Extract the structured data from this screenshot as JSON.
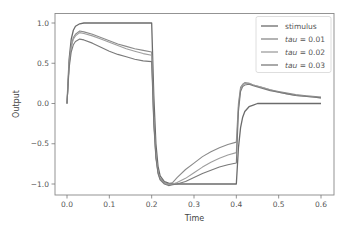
{
  "chart_data": {
    "type": "line",
    "title": "",
    "xlabel": "Time",
    "ylabel": "Output",
    "xlim": [
      -0.02,
      0.62
    ],
    "ylim": [
      -1.15,
      1.12
    ],
    "grid": false,
    "legend_position": "upper right",
    "xticks": [
      0.0,
      0.1,
      0.2,
      0.3,
      0.4,
      0.5,
      0.6
    ],
    "xtick_labels": [
      "0.0",
      "0.1",
      "0.2",
      "0.3",
      "0.4",
      "0.5",
      "0.6"
    ],
    "yticks": [
      1.0,
      0.5,
      0.0,
      -0.5,
      -1.0
    ],
    "ytick_labels": [
      "1.0",
      "0.5",
      "0.0",
      "−0.5",
      "−1.0"
    ],
    "series": [
      {
        "name": "stimulus",
        "label_prefix": "stimulus",
        "label_value": "",
        "color": "#6b6b6b",
        "x": [
          0.0,
          0.005,
          0.01,
          0.015,
          0.02,
          0.03,
          0.04,
          0.05,
          0.1,
          0.2,
          0.2,
          0.205,
          0.21,
          0.215,
          0.22,
          0.23,
          0.24,
          0.25,
          0.3,
          0.4,
          0.4,
          0.405,
          0.41,
          0.415,
          0.42,
          0.43,
          0.44,
          0.45,
          0.5,
          0.6
        ],
        "y": [
          0.0,
          0.55,
          0.8,
          0.91,
          0.96,
          0.99,
          1.0,
          1.0,
          1.0,
          1.0,
          1.0,
          0.1,
          -0.5,
          -0.78,
          -0.9,
          -0.97,
          -0.99,
          -1.0,
          -1.0,
          -1.0,
          -1.0,
          -0.55,
          -0.3,
          -0.17,
          -0.1,
          -0.04,
          -0.02,
          0.0,
          0.0,
          0.0
        ]
      },
      {
        "name": "tau = 0.01",
        "label_prefix": "tau",
        "label_value": " = 0.01",
        "color": "#8a8a8a",
        "x": [
          0.0,
          0.005,
          0.01,
          0.015,
          0.02,
          0.03,
          0.04,
          0.06,
          0.08,
          0.1,
          0.12,
          0.14,
          0.16,
          0.18,
          0.2,
          0.205,
          0.21,
          0.215,
          0.22,
          0.23,
          0.24,
          0.25,
          0.26,
          0.28,
          0.3,
          0.32,
          0.34,
          0.36,
          0.38,
          0.4,
          0.405,
          0.41,
          0.415,
          0.42,
          0.43,
          0.44,
          0.46,
          0.48,
          0.5,
          0.52,
          0.54,
          0.56,
          0.58,
          0.6
        ],
        "y": [
          0.0,
          0.5,
          0.72,
          0.82,
          0.86,
          0.9,
          0.89,
          0.86,
          0.82,
          0.78,
          0.74,
          0.71,
          0.68,
          0.66,
          0.64,
          -0.2,
          -0.65,
          -0.85,
          -0.93,
          -0.98,
          -1.0,
          -0.98,
          -0.92,
          -0.82,
          -0.74,
          -0.66,
          -0.6,
          -0.55,
          -0.51,
          -0.48,
          0.0,
          0.2,
          0.24,
          0.26,
          0.25,
          0.23,
          0.2,
          0.17,
          0.15,
          0.13,
          0.11,
          0.1,
          0.09,
          0.08
        ]
      },
      {
        "name": "tau = 0.02",
        "label_prefix": "tau",
        "label_value": " = 0.02",
        "color": "#9e9e9e",
        "x": [
          0.0,
          0.005,
          0.01,
          0.015,
          0.02,
          0.03,
          0.04,
          0.06,
          0.08,
          0.1,
          0.12,
          0.14,
          0.16,
          0.18,
          0.2,
          0.205,
          0.21,
          0.215,
          0.22,
          0.23,
          0.24,
          0.25,
          0.26,
          0.28,
          0.3,
          0.32,
          0.34,
          0.36,
          0.38,
          0.4,
          0.405,
          0.41,
          0.415,
          0.42,
          0.43,
          0.44,
          0.46,
          0.48,
          0.5,
          0.52,
          0.54,
          0.56,
          0.58,
          0.6
        ],
        "y": [
          0.0,
          0.48,
          0.7,
          0.8,
          0.84,
          0.88,
          0.87,
          0.84,
          0.8,
          0.76,
          0.72,
          0.68,
          0.65,
          0.62,
          0.6,
          -0.22,
          -0.66,
          -0.86,
          -0.94,
          -0.99,
          -1.01,
          -1.0,
          -0.98,
          -0.93,
          -0.86,
          -0.79,
          -0.73,
          -0.68,
          -0.64,
          -0.61,
          -0.05,
          0.18,
          0.23,
          0.25,
          0.25,
          0.23,
          0.2,
          0.17,
          0.14,
          0.12,
          0.1,
          0.09,
          0.08,
          0.07
        ]
      },
      {
        "name": "tau = 0.03",
        "label_prefix": "tau",
        "label_value": " = 0.03",
        "color": "#7a7a7a",
        "x": [
          0.0,
          0.005,
          0.01,
          0.015,
          0.02,
          0.03,
          0.04,
          0.06,
          0.08,
          0.1,
          0.12,
          0.14,
          0.16,
          0.18,
          0.2,
          0.205,
          0.21,
          0.215,
          0.22,
          0.23,
          0.24,
          0.25,
          0.26,
          0.28,
          0.3,
          0.32,
          0.34,
          0.36,
          0.38,
          0.4,
          0.405,
          0.41,
          0.415,
          0.42,
          0.43,
          0.44,
          0.46,
          0.48,
          0.5,
          0.52,
          0.54,
          0.56,
          0.58,
          0.6
        ],
        "y": [
          0.0,
          0.44,
          0.64,
          0.73,
          0.77,
          0.8,
          0.79,
          0.75,
          0.7,
          0.65,
          0.61,
          0.58,
          0.55,
          0.53,
          0.52,
          -0.25,
          -0.68,
          -0.87,
          -0.95,
          -1.0,
          -1.02,
          -1.01,
          -1.0,
          -0.97,
          -0.92,
          -0.87,
          -0.83,
          -0.79,
          -0.76,
          -0.74,
          -0.1,
          0.15,
          0.21,
          0.23,
          0.24,
          0.22,
          0.19,
          0.16,
          0.14,
          0.12,
          0.1,
          0.09,
          0.08,
          0.07
        ]
      }
    ]
  }
}
